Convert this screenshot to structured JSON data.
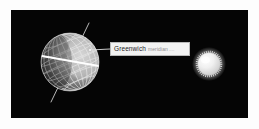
{
  "figure": {
    "background_color": "#050505",
    "matte_color": "#fdfdfd",
    "frame": {
      "x": 11,
      "y": 10,
      "width": 237,
      "height": 108
    }
  },
  "callout": {
    "label": "Greenwich",
    "sublabel": "meridian",
    "trailing": "....",
    "box_fill": "#f2f2f2",
    "box_border": "#b9b9b9",
    "text_color": "#1b1b1b",
    "sub_color": "#8d8d8d"
  },
  "globe": {
    "name": "earth-globe",
    "center_x": 70,
    "center_y": 62,
    "radius": 29,
    "grid_color": "#d8d8d8",
    "terminator_color": "#f4f4f4",
    "axis_tilt_degrees": 23,
    "latitude_lines": 7,
    "longitude_lines": 9,
    "equator_highlight": true
  },
  "sun": {
    "name": "sun-sphere",
    "center_x": 209,
    "center_y": 64,
    "radius": 12,
    "core_color": "#f8f8f8",
    "corona_color": "#e9e9e9",
    "spikes": 48
  },
  "leader_line": {
    "from_x": 90,
    "from_y": 50,
    "to_x": 110,
    "to_y": 49,
    "color": "#dcdcdc"
  }
}
